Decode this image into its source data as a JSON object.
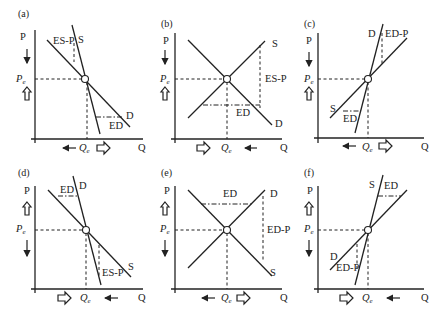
{
  "figure": {
    "panels": [
      {
        "id": "a",
        "label": "(a)",
        "y_axis": "P",
        "x_axis": "Q",
        "pe": "P",
        "pe_sub": "e",
        "qe": "Q",
        "qe_sub": "e",
        "curve1": "S",
        "curve2": "D",
        "gap_top": "ES-P",
        "gap_bottom": "ED",
        "p_arrow_top": "down-thin",
        "p_arrow_bottom": "up-hollow",
        "q_arrow_left": "left-thin",
        "q_arrow_right": "right-hollow"
      },
      {
        "id": "b",
        "label": "(b)",
        "y_axis": "P",
        "x_axis": "Q",
        "pe": "P",
        "pe_sub": "e",
        "qe": "Q",
        "qe_sub": "e",
        "curve1": "S",
        "curve2": "D",
        "gap_top": "ES-P",
        "gap_bottom": "ED",
        "p_arrow_top": "down-thin",
        "p_arrow_bottom": "up-hollow",
        "q_arrow_left": "right-hollow",
        "q_arrow_right": "left-thin"
      },
      {
        "id": "c",
        "label": "(c)",
        "y_axis": "P",
        "x_axis": "Q",
        "pe": "P",
        "pe_sub": "e",
        "qe": "Q",
        "qe_sub": "e",
        "curve1": "D",
        "curve2": "S",
        "gap_top": "ED-P",
        "gap_bottom": "ED",
        "p_arrow_top": "down-thin",
        "p_arrow_bottom": "up-hollow",
        "q_arrow_left": "left-thin",
        "q_arrow_right": "right-hollow"
      },
      {
        "id": "d",
        "label": "(d)",
        "y_axis": "P",
        "x_axis": "Q",
        "pe": "P",
        "pe_sub": "e",
        "qe": "Q",
        "qe_sub": "e",
        "curve1": "D",
        "curve2": "S",
        "gap_top": "ED",
        "gap_bottom": "ES-P",
        "p_arrow_top": "up-hollow",
        "p_arrow_bottom": "down-thin",
        "q_arrow_left": "right-hollow",
        "q_arrow_right": "left-thin"
      },
      {
        "id": "e",
        "label": "(e)",
        "y_axis": "P",
        "x_axis": "Q",
        "pe": "P",
        "pe_sub": "e",
        "qe": "Q",
        "qe_sub": "e",
        "curve1": "D",
        "curve2": "S",
        "gap_top": "ED",
        "gap_bottom": "ED-P",
        "p_arrow_top": "up-hollow",
        "p_arrow_bottom": "down-thin",
        "q_arrow_left": "left-thin",
        "q_arrow_right": "right-hollow"
      },
      {
        "id": "f",
        "label": "(f)",
        "y_axis": "P",
        "x_axis": "Q",
        "pe": "P",
        "pe_sub": "e",
        "qe": "Q",
        "qe_sub": "e",
        "curve1": "S",
        "curve2": "D",
        "gap_top": "ED",
        "gap_bottom": "ED-P",
        "p_arrow_top": "up-hollow",
        "p_arrow_bottom": "down-thin",
        "q_arrow_left": "right-hollow",
        "q_arrow_right": "left-thin"
      }
    ]
  }
}
